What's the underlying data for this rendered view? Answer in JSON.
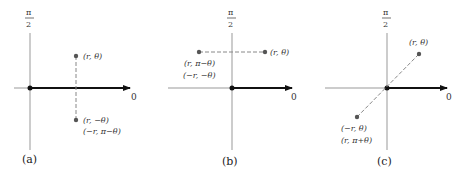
{
  "panels": [
    {
      "id": "a",
      "caption": "(a)",
      "top_axis_label_num": "π",
      "top_axis_label_den": "2",
      "polar_axis_label": "0",
      "point_upper": "(r, θ)",
      "point_lower_1": "(r, −θ)",
      "point_lower_2": "(−r, π−θ)"
    },
    {
      "id": "b",
      "caption": "(b)",
      "top_axis_label_num": "π",
      "top_axis_label_den": "2",
      "polar_axis_label": "0",
      "point_right": "(r, θ)",
      "point_left_1": "(r, π−θ)",
      "point_left_2": "(−r, −θ)"
    },
    {
      "id": "c",
      "caption": "(c)",
      "top_axis_label_num": "π",
      "top_axis_label_den": "2",
      "polar_axis_label": "0",
      "point_upper": "(r, θ)",
      "point_lower_1": "(−r, θ)",
      "point_lower_2": "(r, π+θ)"
    }
  ],
  "colors": {
    "axis": "#999999",
    "polar_axis": "#111111",
    "point": "#555555",
    "dash": "#888888"
  }
}
